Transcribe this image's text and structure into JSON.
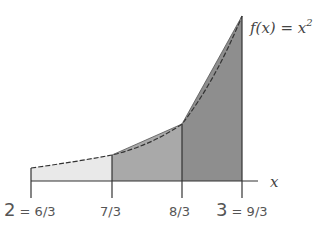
{
  "figure": {
    "function_label_prefix": "f(x) = x",
    "function_label_exp": "2",
    "axis_label": "x",
    "ticks": [
      {
        "label_big": "2",
        "label_eq": " = 6/3",
        "value": 2
      },
      {
        "label_big": "",
        "label_eq": "7/3",
        "value": 2.3333
      },
      {
        "label_big": "",
        "label_eq": "8/3",
        "value": 2.6667
      },
      {
        "label_big": "3",
        "label_eq": " = 9/3",
        "value": 3
      }
    ],
    "regions": [
      {
        "name": "strip-1",
        "from": "6/3",
        "to": "7/3",
        "color": "#e9e9e9"
      },
      {
        "name": "strip-2",
        "from": "7/3",
        "to": "8/3",
        "color": "#a9a9a9"
      },
      {
        "name": "strip-3",
        "from": "8/3",
        "to": "9/3",
        "color": "#8e8e8e"
      }
    ],
    "colors": {
      "axis": "#333333",
      "curve": "#333333"
    }
  }
}
